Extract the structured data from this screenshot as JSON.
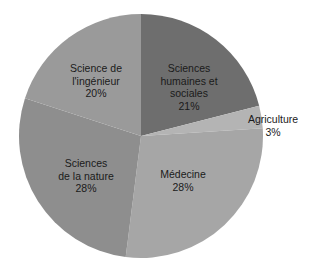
{
  "chart_data": {
    "type": "pie",
    "title": "",
    "start_angle_deg": 0,
    "direction": "clockwise",
    "slices": [
      {
        "label": "Sciences humaines et sociales",
        "label_lines": [
          "Sciences",
          "humaines et",
          "sociales"
        ],
        "value": 21,
        "value_label": "21%",
        "color": "#6e6e6e"
      },
      {
        "label": "Agriculture",
        "label_lines": [
          "Agriculture"
        ],
        "value": 3,
        "value_label": "3%",
        "color": "#b4b4b4"
      },
      {
        "label": "Médecine",
        "label_lines": [
          "Médecine"
        ],
        "value": 28,
        "value_label": "28%",
        "color": "#a6a6a6"
      },
      {
        "label": "Sciences de la nature",
        "label_lines": [
          "Sciences",
          "de la nature"
        ],
        "value": 28,
        "value_label": "28%",
        "color": "#8e8e8e"
      },
      {
        "label": "Science de l'ingénieur",
        "label_lines": [
          "Science de",
          "l'ingénieur"
        ],
        "value": 20,
        "value_label": "20%",
        "color": "#9a9a9a"
      }
    ],
    "legend": "none",
    "labels_position": "inside"
  },
  "labels": {
    "shs": {
      "l1": "Sciences",
      "l2": "humaines et",
      "l3": "sociales",
      "pct": "21%"
    },
    "agri": {
      "l1": "Agriculture",
      "pct": "3%"
    },
    "med": {
      "l1": "Médecine",
      "pct": "28%"
    },
    "nat": {
      "l1": "Sciences",
      "l2": "de la nature",
      "pct": "28%"
    },
    "ing": {
      "l1": "Science de",
      "l2": "l'ingénieur",
      "pct": "20%"
    }
  }
}
